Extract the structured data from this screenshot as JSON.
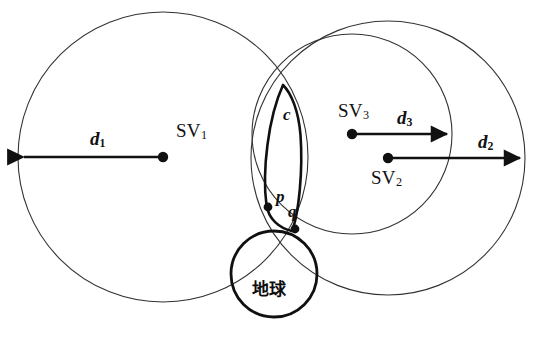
{
  "figure": {
    "type": "geometric-diagram",
    "domain": "satellite-positioning-geometry",
    "background_color": "#ffffff",
    "stroke_color": "#1a1a1a",
    "width": 537,
    "height": 341
  },
  "labels": {
    "sv1": "SV",
    "sv1_sub": "1",
    "sv2": "SV",
    "sv2_sub": "2",
    "sv3": "SV",
    "sv3_sub": "3",
    "d1": "d",
    "d1_sub": "1",
    "d2": "d",
    "d2_sub": "2",
    "d3": "d",
    "d3_sub": "3",
    "c": "c",
    "p": "p",
    "q": "q",
    "earth": "地球"
  },
  "circles": [
    {
      "name": "sv1-range-circle",
      "center_label": "SV1",
      "cx": 163,
      "cy": 157,
      "r": 145,
      "stroke_width": 1.1,
      "radius_label": "d1"
    },
    {
      "name": "sv3-range-circle",
      "center_label": "SV3",
      "cx": 352,
      "cy": 134,
      "r": 100,
      "stroke_width": 1.1,
      "radius_label": "d3"
    },
    {
      "name": "sv2-range-circle",
      "center_label": "SV2",
      "cx": 388,
      "cy": 158,
      "r": 137,
      "stroke_width": 1.1,
      "radius_label": "d2"
    },
    {
      "name": "earth-circle",
      "center_label": "地球",
      "cx": 274,
      "cy": 274,
      "r": 43,
      "stroke_width": 2.8,
      "radius_label": ""
    }
  ],
  "lens": {
    "name": "intersection-lens-c",
    "label": "c",
    "stroke_width": 2.6,
    "top_x": 283,
    "top_y": 85,
    "bottom_x": 292,
    "bottom_y": 231
  },
  "points": [
    {
      "name": "point-p",
      "label": "p",
      "cx": 268,
      "cy": 207,
      "r": 4.4
    },
    {
      "name": "point-q",
      "label": "q",
      "cx": 295,
      "cy": 229,
      "r": 4.4
    }
  ],
  "satellite_markers": [
    {
      "name": "sv1-marker",
      "label": "SV1",
      "cx": 163,
      "cy": 157,
      "r": 5.2
    },
    {
      "name": "sv3-marker",
      "label": "SV3",
      "cx": 352,
      "cy": 134,
      "r": 5.2
    },
    {
      "name": "sv2-marker",
      "label": "SV2",
      "cx": 388,
      "cy": 158,
      "r": 5.2
    }
  ],
  "arrows": [
    {
      "name": "d1-radius-arrow",
      "label": "d1",
      "x1": 163,
      "y1": 157,
      "x2": 19,
      "y2": 157,
      "direction": "left",
      "stroke_width": 2.6
    },
    {
      "name": "d3-radius-arrow",
      "label": "d3",
      "x1": 352,
      "y1": 134,
      "x2": 452,
      "y2": 134,
      "direction": "right",
      "stroke_width": 2.6
    },
    {
      "name": "d2-radius-arrow",
      "label": "d2",
      "x1": 388,
      "y1": 158,
      "x2": 525,
      "y2": 158,
      "direction": "right",
      "stroke_width": 2.6
    }
  ],
  "caption": {
    "text": ""
  }
}
